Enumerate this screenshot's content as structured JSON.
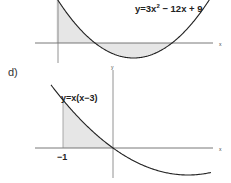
{
  "chart_data": [
    {
      "type": "area",
      "id": "c",
      "function": "3x^2 - 12x + 9",
      "curve_label": "y=3x",
      "curve_label_exp": "2",
      "curve_label_rest": " − 12x + 9",
      "xlabel": "x",
      "ylabel": "",
      "roots": [
        1,
        3
      ],
      "shaded_interval": [
        0,
        3
      ],
      "grid": false,
      "colors": {
        "curve": "#222222",
        "axis": "#555555",
        "shade": "#e6e6e6"
      }
    },
    {
      "type": "area",
      "id": "d",
      "part_label": "d)",
      "function": "x(x-3)",
      "curve_label": "y=x(x−3)",
      "xlabel": "x",
      "ylabel": "y",
      "x_tick_labels": [
        "−1"
      ],
      "shaded_interval": [
        -1,
        0
      ],
      "grid": false,
      "colors": {
        "curve": "#222222",
        "axis": "#555555",
        "shade": "#e6e6e6"
      }
    }
  ]
}
